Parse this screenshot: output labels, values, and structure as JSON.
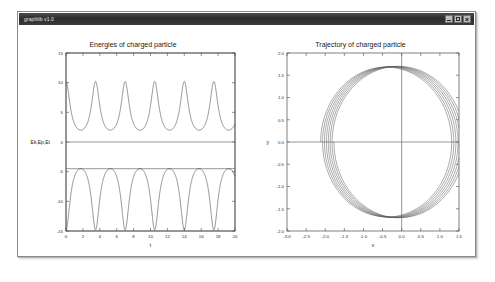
{
  "window": {
    "title": "graphlib v1.0",
    "controls": [
      {
        "name": "minimize",
        "label": "_"
      },
      {
        "name": "maximize",
        "label": "□"
      },
      {
        "name": "close",
        "label": "×"
      }
    ]
  },
  "colors": {
    "titlebar": "#2d2d2d",
    "title_text": "#e8e8e8",
    "client_bg": "#ffffff",
    "axis": "#4a4a4a",
    "curve": "#3a3a3a",
    "window_border": "#8a8a8a"
  },
  "chart_data": [
    {
      "id": "energies",
      "type": "line",
      "title": "Energies of charged particle",
      "xlabel": "t",
      "ylabel": "Ek,Ep,Et",
      "xlim": [
        0,
        20
      ],
      "ylim": [
        -15,
        15
      ],
      "xticks": [
        0,
        2,
        4,
        6,
        8,
        10,
        12,
        14,
        16,
        18,
        20
      ],
      "yticks": [
        15,
        10,
        5,
        0,
        -5,
        -10,
        -15
      ],
      "xticklabels": [
        "0",
        "2",
        "4",
        "6",
        "8",
        "10",
        "12",
        "14",
        "16",
        "18",
        "20"
      ],
      "yticklabels": [
        "15",
        "10",
        "5",
        "0",
        "-5",
        "-10",
        "-15"
      ],
      "grid": false,
      "legend": null,
      "series": [
        {
          "name": "Ek",
          "description": "kinetic energy: periodic cusped peaks, period ~3.5, min ~2.0, max ~10.2",
          "period": 3.5,
          "ymin": 2.0,
          "ymax": 10.2,
          "phase": 0.0,
          "shape": "cusped-peak"
        },
        {
          "name": "Ep",
          "description": "potential energy: periodic inverted cusped dips, period ~3.5, max ~-4.5, min ~-14.8",
          "period": 3.5,
          "ymin": -14.8,
          "ymax": -4.5,
          "phase": 0.0,
          "shape": "cusped-dip"
        },
        {
          "name": "Et",
          "description": "total energy: constant flat line at 0",
          "constant": 0.0,
          "shape": "flat"
        },
        {
          "name": "Ep-envelope",
          "description": "flat reference line at -4.5",
          "constant": -4.5,
          "shape": "flat"
        }
      ]
    },
    {
      "id": "trajectory",
      "type": "line",
      "title": "Trajectory of charged particle",
      "xlabel": "x",
      "ylabel": "y",
      "xlim": [
        -3.0,
        1.5
      ],
      "ylim": [
        -2.0,
        2.0
      ],
      "xticks": [
        -3.0,
        -2.5,
        -2.0,
        -1.5,
        -1.0,
        -0.5,
        0.0,
        0.5,
        1.0,
        1.5
      ],
      "yticks": [
        2.0,
        1.5,
        1.0,
        0.5,
        0.0,
        -0.5,
        -1.0,
        -1.5,
        -2.0
      ],
      "xticklabels": [
        "-3.0",
        "-2.5",
        "-2.0",
        "-1.5",
        "-1.0",
        "-0.5",
        "0.0",
        "0.5",
        "1.0",
        "1.5"
      ],
      "yticklabels": [
        "2.0",
        "1.5",
        "1.0",
        "0.5",
        "0.0",
        "-0.5",
        "-1.0",
        "-1.5",
        "-2.0"
      ],
      "grid": false,
      "legend": null,
      "zero_lines": {
        "x": 0.0,
        "y": 0.0
      },
      "series": [
        {
          "name": "orbit",
          "description": "precessing near-circular orbit, ~7 loops drifting leftward; radius ~1.7, centers drift from (-0.05,0) to (-0.42,0)",
          "loops": 7,
          "radius": 1.72,
          "center_start": [
            -0.05,
            0.0
          ],
          "center_end": [
            -0.42,
            0.0
          ],
          "shape": "precessing-circle"
        }
      ]
    }
  ]
}
